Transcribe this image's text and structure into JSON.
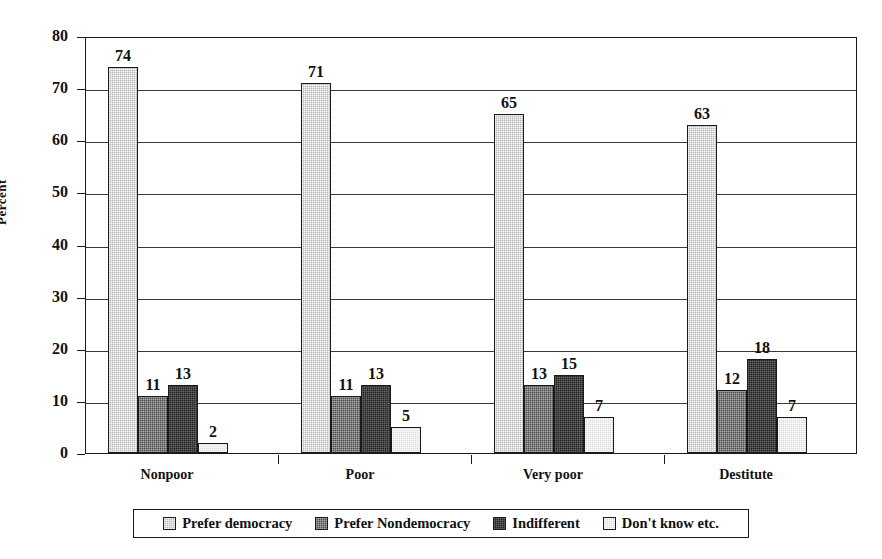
{
  "chart_data": {
    "type": "bar",
    "title": "",
    "xlabel": "",
    "ylabel": "Percent",
    "ylim": [
      0,
      80
    ],
    "ytick_step": 10,
    "yticks": [
      0,
      10,
      20,
      30,
      40,
      50,
      60,
      70,
      80
    ],
    "ytick_labels": [
      "0",
      "10",
      "20",
      "30",
      "40",
      "50",
      "60",
      "70",
      "80"
    ],
    "grid": "horizontal",
    "legend_position": "bottom",
    "categories": [
      "Nonpoor",
      "Poor",
      "Very poor",
      "Destitute"
    ],
    "series": [
      {
        "name": "Prefer democracy",
        "color": "#b9b9b9",
        "values": [
          74,
          71,
          65,
          63
        ]
      },
      {
        "name": "Prefer Nondemocracy",
        "color": "#4a4a4a",
        "values": [
          11,
          11,
          13,
          12
        ]
      },
      {
        "name": "Indifferent",
        "color": "#232323",
        "values": [
          13,
          13,
          15,
          18
        ]
      },
      {
        "name": "Don't know etc.",
        "color": "#dcdcdc",
        "values": [
          2,
          5,
          7,
          7
        ]
      }
    ],
    "value_labels": [
      [
        "74",
        "11",
        "13",
        "2"
      ],
      [
        "71",
        "11",
        "13",
        "5"
      ],
      [
        "65",
        "13",
        "15",
        "7"
      ],
      [
        "63",
        "12",
        "18",
        "7"
      ]
    ]
  },
  "legend": {
    "items": [
      {
        "label": "Prefer democracy",
        "swatch": "legend-swatch-prefer-democracy"
      },
      {
        "label": "Prefer Nondemocracy",
        "swatch": "legend-swatch-prefer-nondemocracy"
      },
      {
        "label": "Indifferent",
        "swatch": "legend-swatch-indifferent"
      },
      {
        "label": "Don't know etc.",
        "swatch": "legend-swatch-dont-know"
      }
    ]
  }
}
